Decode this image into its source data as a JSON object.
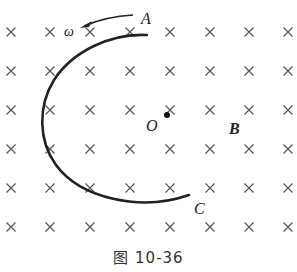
{
  "figure": {
    "caption": "图 10-36",
    "labels": {
      "A": "A",
      "C": "C",
      "O": "O",
      "B": "B",
      "omega": "ω"
    },
    "field": {
      "symbol": "×",
      "direction": "into-page",
      "columns_x": [
        11,
        50,
        90,
        130,
        170,
        210,
        249,
        288
      ],
      "rows_y": [
        32,
        71,
        110,
        149,
        188,
        227
      ],
      "color": "#555555"
    },
    "arc": {
      "color": "#222222",
      "start": "A",
      "end": "C"
    },
    "rotation_arrow": {
      "direction": "counterclockwise",
      "color": "#222222"
    }
  }
}
